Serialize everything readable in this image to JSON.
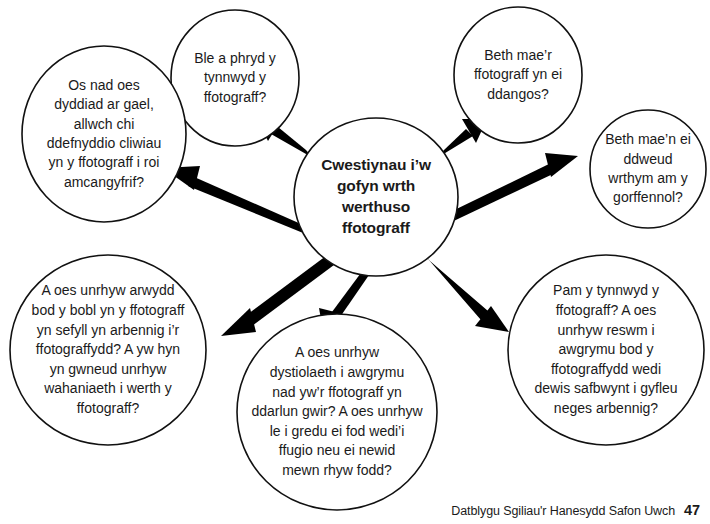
{
  "diagram": {
    "type": "spoke-and-hub-mind-map",
    "center": {
      "id": "center",
      "text": "Cwestiynau i’w\ngofyn wrth\nwerthuso\nffotograff"
    },
    "nodes": [
      {
        "id": "top-left",
        "text": "Ble a phryd y\ntynnwyd y\nffotograff?"
      },
      {
        "id": "left",
        "text": "Os nad oes\ndyddiad ar gael,\nallwch chi\nddefnyddio cliwiau\nyn y ffotograff i roi\namcangyfrif?"
      },
      {
        "id": "top-right",
        "text": "Beth mae’r\nffotograff yn ei\nddangos?"
      },
      {
        "id": "right",
        "text": "Beth mae’n ei\nddweud\nwrthym am y\ngorffennol?"
      },
      {
        "id": "bottom-left",
        "text": "A oes unrhyw arwydd\nbod y bobl yn y ffotograff\nyn sefyll yn arbennig i’r\nffotograffydd? A yw hyn\nyn gwneud unrhyw\nwahaniaeth i werth y\nffotograff?"
      },
      {
        "id": "bottom-center",
        "text": "A oes unrhyw\ndystiolaeth i awgrymu\nnad yw’r ffotograff yn\nddarlun gwir? A oes unrhyw\nle i gredu ei fod wedi’i\nffugio neu ei newid\nmewn rhyw fodd?"
      },
      {
        "id": "bottom-right",
        "text": "Pam y tynnwyd y\nffotograff? A oes\nunrhyw reswm i\nawgrymu bod y\nffotograffydd wedi\ndewis safbwynt i gyfleu\nneges arbennig?"
      }
    ],
    "colors": {
      "stroke": "#111111",
      "fill": "#ffffff",
      "text": "#1a1a1a",
      "arrow": "#000000"
    }
  },
  "footer": {
    "caption": "Datblygu Sgiliau'r Hanesydd Safon Uwch",
    "page_number": "47"
  }
}
